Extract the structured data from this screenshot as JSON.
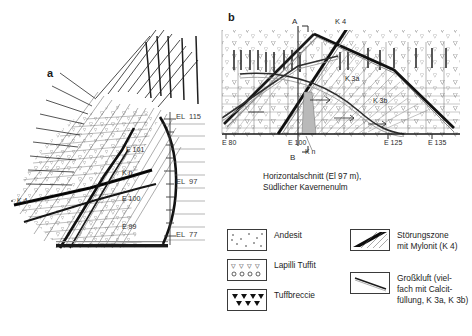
{
  "figure": {
    "panel_a": {
      "letter": "a",
      "labels": [
        {
          "text": "EL  115",
          "x": 176,
          "y": 117
        },
        {
          "text": "EL  97",
          "x": 176,
          "y": 182
        },
        {
          "text": "EL  77",
          "x": 176,
          "y": 234
        },
        {
          "text": "E 101",
          "x": 126,
          "y": 149
        },
        {
          "text": "K n",
          "x": 122,
          "y": 172
        },
        {
          "text": "E 100",
          "x": 122,
          "y": 198
        },
        {
          "text": "E 99",
          "x": 122,
          "y": 226
        },
        {
          "text": "K 4",
          "x": 17,
          "y": 200
        }
      ]
    },
    "panel_b": {
      "letter": "b",
      "labels": [
        {
          "text": "A",
          "x": 292,
          "y": 22
        },
        {
          "text": "B",
          "x": 290,
          "y": 158
        },
        {
          "text": "K 4",
          "x": 335,
          "y": 22
        },
        {
          "text": "K 3a",
          "x": 348,
          "y": 78
        },
        {
          "text": "K 3b",
          "x": 375,
          "y": 100
        },
        {
          "text": "K n",
          "x": 308,
          "y": 150
        },
        {
          "text": "E 80",
          "x": 223,
          "y": 142
        },
        {
          "text": "E 100",
          "x": 290,
          "y": 142
        },
        {
          "text": "E 125",
          "x": 386,
          "y": 142
        },
        {
          "text": "E 135",
          "x": 430,
          "y": 142
        }
      ],
      "caption": "Horizontalschnitt (El 97 m),\nSüdlicher Kavernenulm"
    },
    "legend": {
      "items": [
        {
          "key": "andesit",
          "label": "Andesit",
          "pattern": "sparse-dots"
        },
        {
          "key": "lapilli",
          "label": "Lapilli Tuffit",
          "pattern": "v-and-o"
        },
        {
          "key": "tuffbreccie",
          "label": "Tuffbreccie",
          "pattern": "filled-triangles"
        },
        {
          "key": "stoerungszone",
          "label": "Störungszone\nmit Mylonit (K 4)",
          "pattern": "black-band"
        },
        {
          "key": "grosskluft",
          "label": "Großkluft (viel-\nfach mit Calcit-\nfüllung, K 3a, K 3b)",
          "pattern": "thin-line"
        }
      ]
    },
    "colors": {
      "ink": "#1a1a1a",
      "mid": "#555555",
      "light": "#8a8a8a",
      "fill": "#bdbdbd",
      "paper": "#ffffff"
    }
  }
}
